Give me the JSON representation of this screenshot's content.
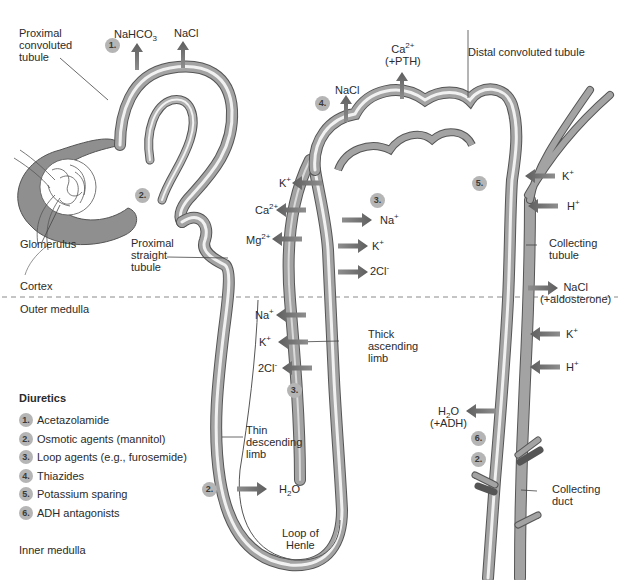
{
  "diagram": {
    "colors": {
      "tubule_wall": "#9a9a9a",
      "tubule_outline": "#555555",
      "arrow": "#6f6f6f",
      "badge": "#b5b5b5",
      "text": "#2b2b2b",
      "zone_divider": "#8a8a8a"
    },
    "structures": {
      "proximal_convoluted": "Proximal\nconvoluted\ntubule",
      "glomerulus": "Glomerulus",
      "proximal_straight": "Proximal\nstraight\ntubule",
      "thin_descending": "Thin\ndescending\nlimb",
      "loop_of_henle": "Loop of\nHenle",
      "thick_ascending": "Thick\nascending\nlimb",
      "distal_convoluted": "Distal convoluted tubule",
      "collecting_tubule": "Collecting\ntubule",
      "collecting_duct": "Collecting\nduct"
    },
    "zones": {
      "cortex": "Cortex",
      "outer_medulla": "Outer medulla",
      "inner_medulla": "Inner medulla"
    },
    "transport": {
      "pct_nahco3": "NaHCO3",
      "pct_nacl": "NaCl",
      "dct_ca": "Ca2+",
      "dct_pth": "(+PTH)",
      "dct_nacl": "NaCl",
      "tal_k_out": "K+",
      "tal_ca": "Ca2+",
      "tal_mg": "Mg2+",
      "tal_na_in": "Na+",
      "tal_k_in": "K+",
      "tal_cl_in": "2Cl-",
      "tal_na_med": "Na+",
      "tal_k_med": "K+",
      "tal_cl_med": "2Cl-",
      "tdl_h2o": "H2O",
      "ct_k": "K+",
      "ct_h": "H+",
      "ct_nacl": "NaCl",
      "ct_aldo": "(+aldosterone)",
      "cd_k": "K+",
      "cd_h": "H+",
      "cd_h2o": "H2O",
      "cd_adh": "(+ADH)"
    },
    "site_badges": [
      {
        "id": "pct",
        "num": "1."
      },
      {
        "id": "pst",
        "num": "2."
      },
      {
        "id": "dct",
        "num": "4."
      },
      {
        "id": "tal_cortex",
        "num": "3."
      },
      {
        "id": "tal_medulla",
        "num": "3."
      },
      {
        "id": "collecting",
        "num": "5."
      },
      {
        "id": "tdl",
        "num": "2."
      },
      {
        "id": "cd_adh",
        "num": "6."
      },
      {
        "id": "cd_osm",
        "num": "2."
      }
    ]
  },
  "legend": {
    "title": "Diuretics",
    "items": [
      {
        "num": "1.",
        "label": "Acetazolamide"
      },
      {
        "num": "2.",
        "label": "Osmotic agents (mannitol)"
      },
      {
        "num": "3.",
        "label": "Loop agents (e.g., furosemide)"
      },
      {
        "num": "4.",
        "label": "Thiazides"
      },
      {
        "num": "5.",
        "label": "Potassium sparing"
      },
      {
        "num": "6.",
        "label": "ADH antagonists"
      }
    ]
  }
}
